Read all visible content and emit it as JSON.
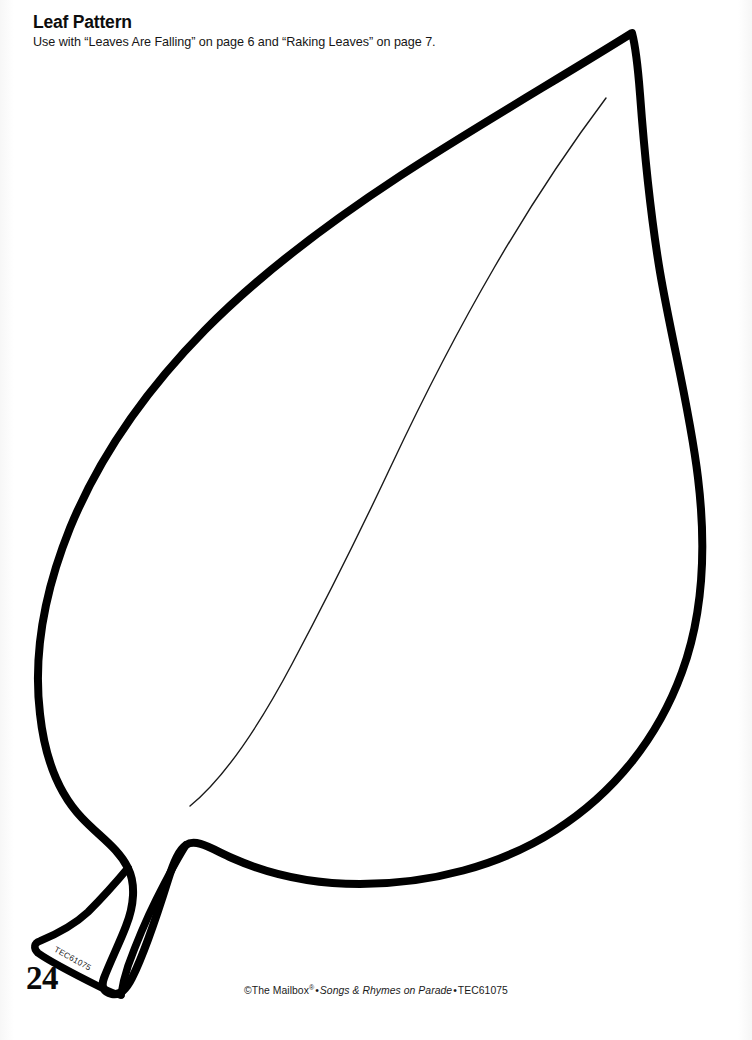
{
  "document": {
    "title": "Leaf Pattern",
    "subtitle": "Use with “Leaves Are Falling” on page 6 and “Raking Leaves” on page 7.",
    "page_number": "24",
    "background_color": "#ffffff",
    "ink_color": "#000000"
  },
  "artwork": {
    "name": "leaf-pattern-outline",
    "description": "Large single leaf cut-out pattern with thick black outline, thin interior midrib vein, and a short tapered stem at the lower left.",
    "outline_stroke_color": "#000000",
    "outline_stroke_width": 8,
    "vein_stroke_color": "#1a1a1a",
    "vein_stroke_width": 1.4,
    "stem_code": "TEC61075"
  },
  "footer": {
    "copyright": "©The Mailbox",
    "registered_mark": "®",
    "separator": "•",
    "publication": "Songs & Rhymes on Parade",
    "item_code": "TEC61075"
  }
}
